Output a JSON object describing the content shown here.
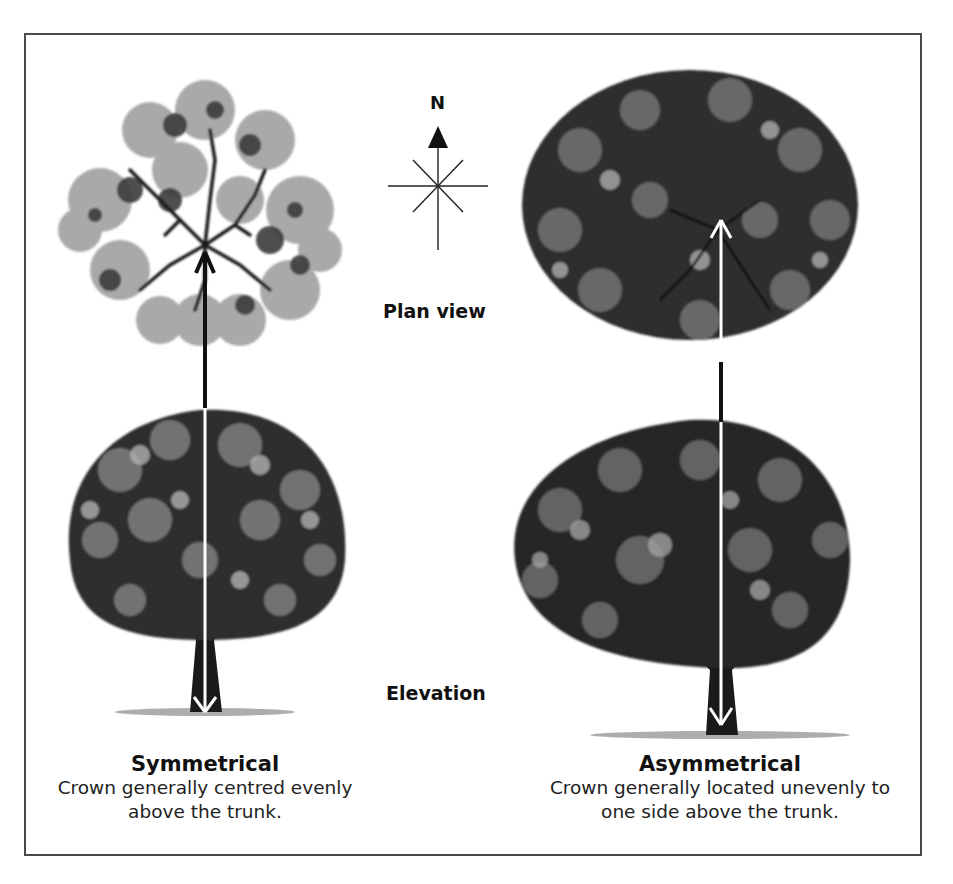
{
  "figure": {
    "compass": {
      "label": "N",
      "icon": "compass-rose-icon"
    },
    "view_labels": {
      "plan": "Plan view",
      "elevation": "Elevation"
    },
    "columns": [
      {
        "title": "Symmetrical",
        "description_line1": "Crown generally centred evenly",
        "description_line2": "above the trunk."
      },
      {
        "title": "Asymmetrical",
        "description_line1": "Crown generally located unevenly to",
        "description_line2": "one side above the trunk."
      }
    ],
    "colors": {
      "frame": "#4a4a4a",
      "ink": "#111111",
      "foliage_dark": "#2b2b2b",
      "foliage_mid": "#6e6e6e",
      "foliage_light": "#a8a8a8"
    }
  }
}
